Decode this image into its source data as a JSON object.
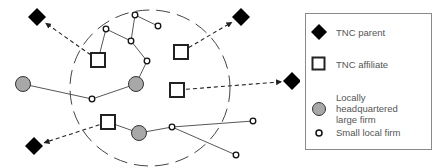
{
  "colors": {
    "parent_fill": "#000000",
    "affiliate_stroke": "#222222",
    "large_firm_fill": "#a8a8a8",
    "edge": "#444444",
    "region_boundary": "#444444",
    "legend_border": "#8a8a8a",
    "legend_text": "#555555"
  },
  "legend": {
    "items": [
      {
        "symbol": "black-diamond",
        "label": "TNC parent"
      },
      {
        "symbol": "hollow-square",
        "label": "TNC affiliate"
      },
      {
        "symbol": "grey-circle",
        "label": "Locally headquartered large firm"
      },
      {
        "symbol": "small-hollow-circle",
        "label": "Small local firm"
      }
    ]
  },
  "diagram": {
    "region": {
      "type": "dashed-ellipse",
      "cx": 150,
      "cy": 88,
      "rx": 80,
      "ry": 78
    },
    "nodes": [
      {
        "id": "p1",
        "type": "tnc_parent",
        "x": 37,
        "y": 17
      },
      {
        "id": "p2",
        "type": "tnc_parent",
        "x": 241,
        "y": 17
      },
      {
        "id": "p3",
        "type": "tnc_parent",
        "x": 292,
        "y": 81
      },
      {
        "id": "p4",
        "type": "tnc_parent",
        "x": 34,
        "y": 146
      },
      {
        "id": "a1",
        "type": "tnc_affiliate",
        "x": 98,
        "y": 60
      },
      {
        "id": "a2",
        "type": "tnc_affiliate",
        "x": 181,
        "y": 52
      },
      {
        "id": "a3",
        "type": "tnc_affiliate",
        "x": 177,
        "y": 90
      },
      {
        "id": "a4",
        "type": "tnc_affiliate",
        "x": 108,
        "y": 122
      },
      {
        "id": "l1",
        "type": "large_firm",
        "x": 23,
        "y": 84
      },
      {
        "id": "l2",
        "type": "large_firm",
        "x": 136,
        "y": 84
      },
      {
        "id": "l3",
        "type": "large_firm",
        "x": 139,
        "y": 133
      },
      {
        "id": "s1",
        "type": "small_firm",
        "x": 106,
        "y": 29
      },
      {
        "id": "s2",
        "type": "small_firm",
        "x": 135,
        "y": 15
      },
      {
        "id": "s3",
        "type": "small_firm",
        "x": 158,
        "y": 26
      },
      {
        "id": "s4",
        "type": "small_firm",
        "x": 131,
        "y": 41
      },
      {
        "id": "s5",
        "type": "small_firm",
        "x": 147,
        "y": 61
      },
      {
        "id": "s6",
        "type": "small_firm",
        "x": 92,
        "y": 99
      },
      {
        "id": "s7",
        "type": "small_firm",
        "x": 172,
        "y": 127
      },
      {
        "id": "s8",
        "type": "small_firm",
        "x": 253,
        "y": 121
      },
      {
        "id": "s9",
        "type": "small_firm",
        "x": 236,
        "y": 155
      }
    ],
    "local_links": [
      [
        "a1",
        "s1"
      ],
      [
        "s1",
        "s4"
      ],
      [
        "s2",
        "s4"
      ],
      [
        "s2",
        "s3"
      ],
      [
        "s4",
        "s5"
      ],
      [
        "s5",
        "l2"
      ],
      [
        "l1",
        "s6"
      ],
      [
        "s6",
        "l2"
      ],
      [
        "a4",
        "l3"
      ],
      [
        "l3",
        "s7"
      ],
      [
        "s7",
        "s8"
      ],
      [
        "s7",
        "s9"
      ]
    ],
    "ownership_links": [
      {
        "from": "a1",
        "to": "p1"
      },
      {
        "from": "a2",
        "to": "p2"
      },
      {
        "from": "a3",
        "to": "p3"
      },
      {
        "from": "a4",
        "to": "p4"
      }
    ]
  }
}
